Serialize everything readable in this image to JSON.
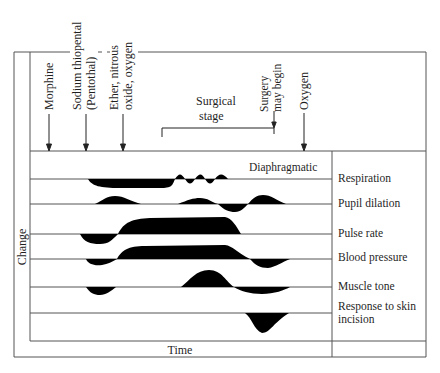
{
  "diagram": {
    "y_axis_label": "Change",
    "x_axis_label": "Time",
    "drug_markers": [
      {
        "label_lines": [
          "Morphine"
        ],
        "x": 49
      },
      {
        "label_lines": [
          "Sodium thiopental",
          "(Pentothal)"
        ],
        "x": 86
      },
      {
        "label_lines": [
          "Ether, nitrous",
          "oxide, oxygen"
        ],
        "x": 123
      },
      {
        "label_lines": [
          "Surgery",
          "may begin"
        ],
        "x": 274
      },
      {
        "label_lines": [
          "Oxygen"
        ],
        "x": 304
      }
    ],
    "surgical_stage": {
      "label_lines": [
        "Surgical",
        "stage"
      ],
      "x_start": 162,
      "x_end": 274
    },
    "annotation": "Diaphragmatic",
    "rows": [
      {
        "label": "Respiration"
      },
      {
        "label": "Pupil dilation"
      },
      {
        "label": "Pulse rate"
      },
      {
        "label": "Blood pressure"
      },
      {
        "label": "Muscle tone"
      },
      {
        "label": "Response to skin",
        "label2": "incision"
      }
    ],
    "colors": {
      "line": "#555555",
      "fill": "#000000",
      "background": "#ffffff"
    }
  }
}
